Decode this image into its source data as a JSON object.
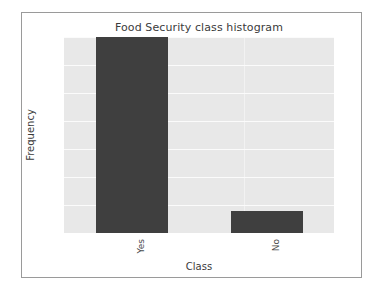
{
  "chart_data": {
    "type": "bar",
    "title": "Food Security class histogram",
    "xlabel": "Class",
    "ylabel": "Frequency",
    "categories": [
      "Yes",
      "No"
    ],
    "values": [
      35,
      4
    ],
    "yticks": [
      0,
      5,
      10,
      15,
      20,
      25,
      30,
      35
    ],
    "ytick_labels": [
      "0",
      "5",
      "10",
      "15",
      "20",
      "25",
      "30",
      "35"
    ],
    "ylim": [
      0,
      35
    ],
    "grid": true,
    "grid_axis": "y",
    "legend": "none",
    "xtick_rotation": 90,
    "bar_color": "#3f3f3f",
    "plot_background": "#e8e8e8",
    "figure_background": "#ffffff",
    "gridline_color": "#fbfbfb",
    "frame_border_color": "#9a9a9a",
    "text_color": "#3b3b3b"
  }
}
